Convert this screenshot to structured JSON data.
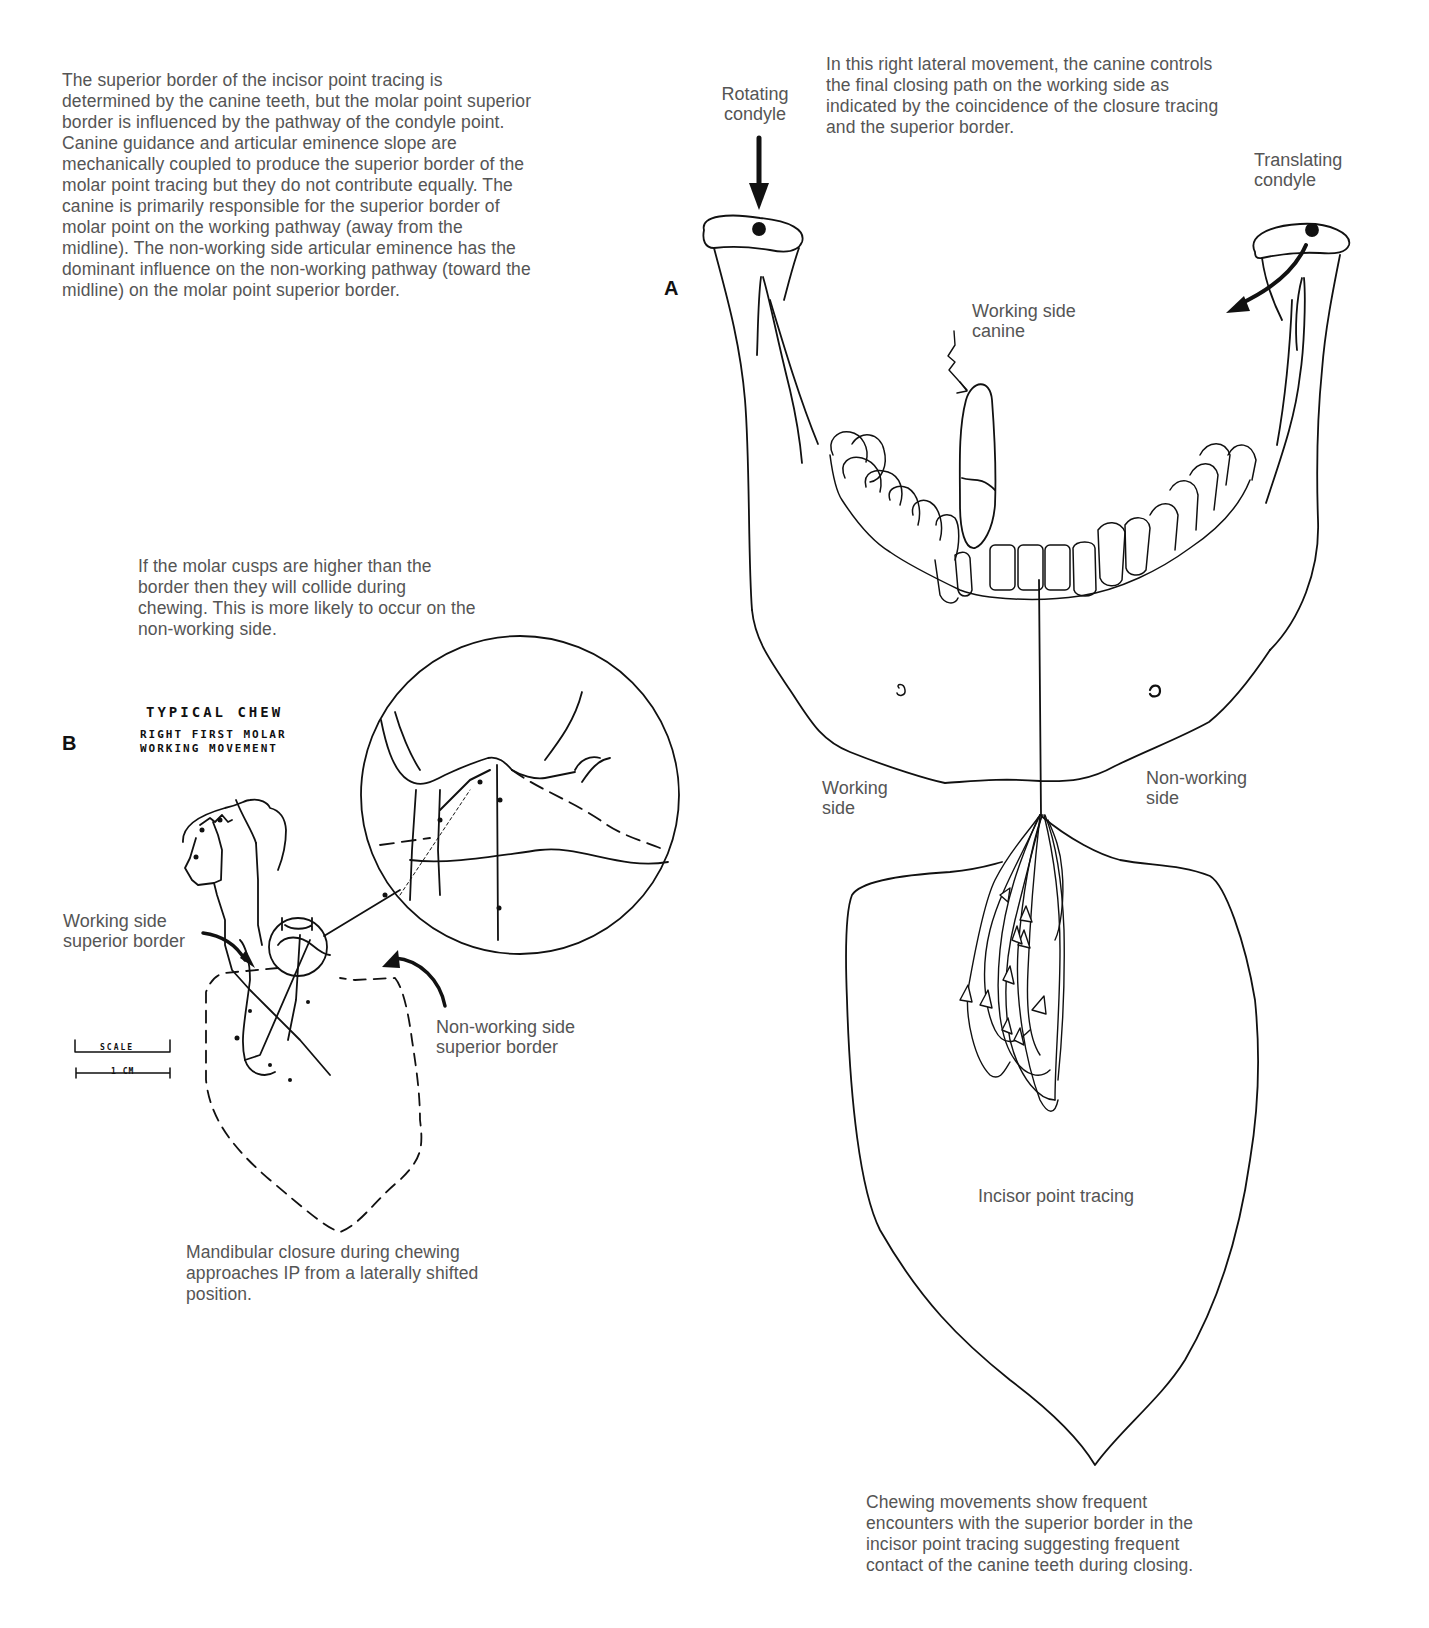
{
  "panel_a": {
    "letter": "A",
    "intro_caption": "In this right lateral movement, the canine controls the final closing path on the working side as indicated by the coincidence of the closure tracing and the superior border.",
    "labels": {
      "rotating_condyle_1": "Rotating",
      "rotating_condyle_2": "condyle",
      "translating_condyle_1": "Translating",
      "translating_condyle_2": "condyle",
      "working_side_canine_1": "Working side",
      "working_side_canine_2": "canine",
      "working_side_1": "Working",
      "working_side_2": "side",
      "non_working_side_1": "Non-working",
      "non_working_side_2": "side",
      "incisor_point_tracing": "Incisor point tracing"
    },
    "bottom_caption": "Chewing movements show frequent encounters with the superior border in the incisor point tracing suggesting frequent contact of the canine teeth during closing."
  },
  "panel_b": {
    "letter": "B",
    "title_1": "TYPICAL CHEW",
    "title_2": "RIGHT FIRST MOLAR",
    "title_3": "WORKING MOVEMENT",
    "upper_caption": "If the molar cusps are higher than the border then they will collide during chewing. This is more likely to occur on the non-working side.",
    "labels": {
      "working_superior_1": "Working side",
      "working_superior_2": "superior border",
      "non_working_superior_1": "Non-working side",
      "non_working_superior_2": "superior border"
    },
    "scale_label": "SCALE",
    "scale_unit": "1 CM",
    "point_numbers": [
      "1",
      "2",
      "3",
      "4",
      "5",
      "6",
      "7",
      "8",
      "9",
      "10"
    ],
    "bottom_caption": "Mandibular closure during chewing approaches IP from a laterally shifted position."
  },
  "intro_text": "The superior border of the incisor point tracing is determined by the canine teeth, but the molar point superior border is influenced by the pathway of the condyle point. Canine guidance and articular eminence slope are mechanically coupled to produce the superior border of the molar point tracing but they do not contribute equally. The canine is primarily responsible for the superior border of molar point on the working pathway (away from the midline). The non-working side articular eminence has the dominant influence on the non-working pathway (toward the midline) on the molar point superior border."
}
